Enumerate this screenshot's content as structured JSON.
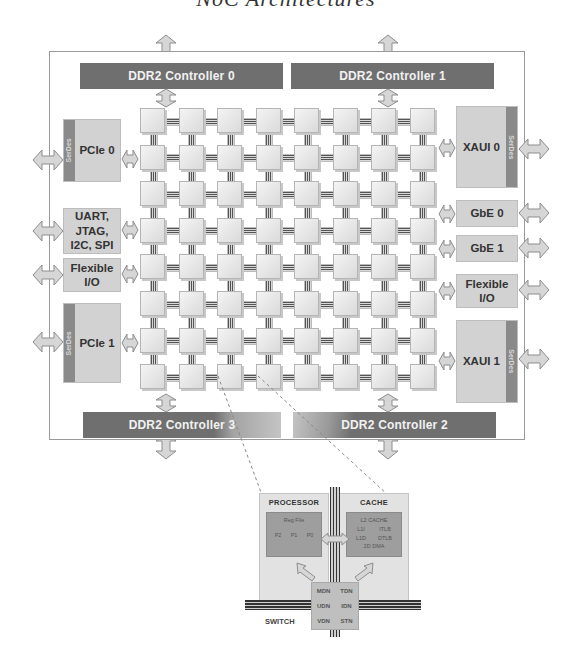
{
  "title": "NoC Architectures",
  "chip": {
    "ddr_controllers": [
      {
        "id": "ddr0",
        "label": "DDR2 Controller 0"
      },
      {
        "id": "ddr1",
        "label": "DDR2 Controller 1"
      },
      {
        "id": "ddr3",
        "label": "DDR2 Controller 3"
      },
      {
        "id": "ddr2",
        "label": "DDR2 Controller 2"
      }
    ],
    "left_io": [
      {
        "id": "pcie0",
        "label": "PCIe 0",
        "serdes": "SerDes"
      },
      {
        "id": "uart",
        "label": "UART,\nJTAG,\nI2C, SPI"
      },
      {
        "id": "flex-left",
        "label": "Flexible\nI/O"
      },
      {
        "id": "pcie1",
        "label": "PCIe 1",
        "serdes": "SerDes"
      }
    ],
    "right_io": [
      {
        "id": "xaui0",
        "label": "XAUI 0",
        "serdes": "SerDes"
      },
      {
        "id": "gbe0",
        "label": "GbE 0"
      },
      {
        "id": "gbe1",
        "label": "GbE 1"
      },
      {
        "id": "flex-right",
        "label": "Flexible\nI/O"
      },
      {
        "id": "xaui1",
        "label": "XAUI 1",
        "serdes": "SerDes"
      }
    ],
    "mesh": {
      "rows": 8,
      "cols": 8
    }
  },
  "tile_detail": {
    "processor": {
      "label": "PROCESSOR",
      "reg_file": "Reg File",
      "pipelines": [
        "P2",
        "P1",
        "P0"
      ]
    },
    "cache": {
      "label": "CACHE",
      "l2": "L2 CACHE",
      "l1i": "L1I",
      "itlb": "ITLB",
      "l1d": "L1D",
      "dtlb": "DTLB",
      "dma": "2D DMA"
    },
    "switch": {
      "label": "SWITCH",
      "networks": [
        "MDN",
        "TDN",
        "UDN",
        "IDN",
        "VDN",
        "STN"
      ]
    }
  }
}
